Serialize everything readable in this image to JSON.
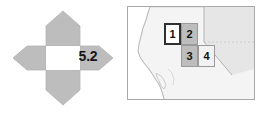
{
  "figure": {
    "width": 263,
    "height": 115,
    "background": "#ffffff"
  },
  "rose": {
    "name": "compass-rose-diagram",
    "center_fill": "#ffffff",
    "arrow_fill": "#bdbdbd",
    "arrow_stroke": "#b0b0b0",
    "label": "5.2",
    "label_color": "#151515",
    "arrows": [
      {
        "direction": "north",
        "name": "arrow-north"
      },
      {
        "direction": "east",
        "name": "arrow-east"
      },
      {
        "direction": "south",
        "name": "arrow-south"
      },
      {
        "direction": "west",
        "name": "arrow-west"
      }
    ]
  },
  "map": {
    "name": "locator-map",
    "frame_color": "#a9a9a9",
    "land_fill": "#f4f4f4",
    "state_fill": "#e4e4e4",
    "ocean_fill": "#ffffff",
    "border_color": "#b5b5b5",
    "coast_color": "#bfbfbf",
    "cells": [
      {
        "label": "1",
        "fill": "#ffffff",
        "border": "#303030",
        "highlight": true,
        "name": "map-cell-1"
      },
      {
        "label": "2",
        "fill": "#bdbdbd",
        "border": "#9a9a9a",
        "highlight": false,
        "name": "map-cell-2"
      },
      {
        "label": "3",
        "fill": "#bdbdbd",
        "border": "#9a9a9a",
        "highlight": false,
        "name": "map-cell-3"
      },
      {
        "label": "4",
        "fill": "#f2f2f2",
        "border": "#9a9a9a",
        "highlight": false,
        "name": "map-cell-4"
      }
    ]
  }
}
